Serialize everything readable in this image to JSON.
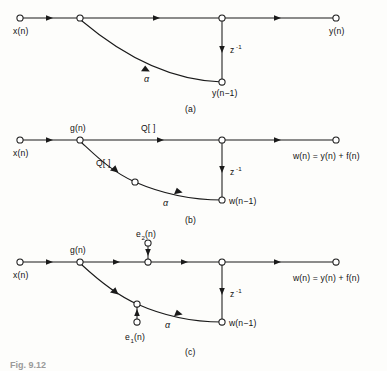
{
  "figure": {
    "type": "signal-flow-graph",
    "panel_count": 3,
    "caption_partial": "Fig. 9.12",
    "panels": [
      {
        "id": "a",
        "caption": "(a)",
        "description": "First-order recursive filter signal flow graph, ideal (infinite precision)",
        "input_label": "x(n)",
        "output_label": "y(n)",
        "delay_label": "z",
        "delay_exponent": "-1",
        "delay_state_label": "y(n−1)",
        "gain_label": "α",
        "branch_labels": []
      },
      {
        "id": "b",
        "caption": "(b)",
        "description": "Same filter with quantizers Q[ ] inserted in forward and feedback paths",
        "input_label": "x(n)",
        "output_label": "w(n) = y(n) + f(n)",
        "delay_label": "z",
        "delay_exponent": "-1",
        "delay_state_label": "w(n−1)",
        "gain_label": "α",
        "node_label": "g(n)",
        "quantizer_forward_label": "Q[ ]",
        "quantizer_feedback_label": "Q[ ]"
      },
      {
        "id": "c",
        "caption": "(c)",
        "description": "Linear noise model with additive error sources e1(n) and e2(n) replacing the quantizers",
        "input_label": "x(n)",
        "output_label": "w(n) = y(n) + f(n)",
        "delay_label": "z",
        "delay_exponent": "-1",
        "delay_state_label": "w(n−1)",
        "gain_label": "α",
        "node_label": "g(n)",
        "noise_source_1": "e",
        "noise_source_1_sub": "1",
        "noise_source_1_suffix": "(n)",
        "noise_source_2": "e",
        "noise_source_2_sub": "2",
        "noise_source_2_suffix": "(n)"
      }
    ]
  },
  "colors": {
    "ink": "#1a1a1a",
    "paper": "#fdfdfb",
    "caption_gray": "#9a9a9a"
  }
}
